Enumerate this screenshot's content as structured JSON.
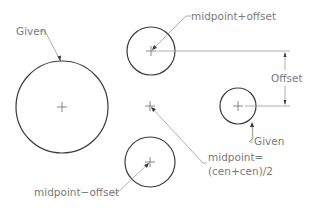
{
  "diagram": {
    "labels": {
      "given_big": "Given",
      "mid_plus": "midpoint+offset",
      "offset": "Offset",
      "given_small": "Given",
      "midpoint_line1": "midpoint=",
      "midpoint_line2": "(cen+cen)/2",
      "mid_minus": "midpoint−offset"
    },
    "circles": [
      {
        "name": "given-large-circle",
        "cx": 62,
        "cy": 107,
        "r": 46
      },
      {
        "name": "midpoint-plus-offset-circle",
        "cx": 151,
        "cy": 51,
        "r": 24
      },
      {
        "name": "midpoint-minus-offset-circle",
        "cx": 150,
        "cy": 162,
        "r": 25
      },
      {
        "name": "given-small-circle",
        "cx": 238,
        "cy": 106,
        "r": 18
      }
    ],
    "colors": {
      "stroke": "#3c3c3c",
      "leader": "#9a9a9a",
      "text": "#7a7a7a",
      "background": "#ffffff"
    }
  }
}
